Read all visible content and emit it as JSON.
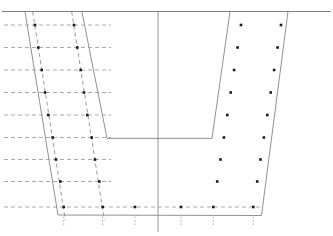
{
  "canvas": {
    "width": 333,
    "height": 236,
    "background": "#ffffff"
  },
  "style": {
    "ground_color": "#7f7f7f",
    "solid_color": "#929292",
    "dashed_color": "#aaaaaa",
    "wall_dashed_color": "#9b9b9b",
    "dot_color": "#1c1c1c",
    "dot_size": 2.6,
    "line_width": 1,
    "ground_line_width": 1.2,
    "dash_pattern": "4 3",
    "tick_pattern": "1.5 2"
  },
  "diagram": {
    "ground_surface_line": {
      "x1": 2,
      "y1": 11.5,
      "x2": 331,
      "y2": 11.5
    },
    "center_axis_line": {
      "x1": 158,
      "y1": 11.5,
      "x2": 158,
      "y2": 232
    },
    "outer_excavation_outline": [
      [
        25,
        12
      ],
      [
        58,
        215
      ],
      [
        261.5,
        215.5
      ],
      [
        288,
        11.5
      ]
    ],
    "inner_excavation_outline": [
      [
        82,
        12
      ],
      [
        107,
        138.4
      ],
      [
        212,
        138.4
      ],
      [
        230,
        11.5
      ]
    ],
    "left_wall_dashed_lines": [
      {
        "x1": 32.7,
        "y1": 11.7,
        "x2": 65.3,
        "y2": 220
      },
      {
        "x1": 71.7,
        "y1": 11.7,
        "x2": 104.3,
        "y2": 220
      }
    ],
    "horizontal_dashed_rows": {
      "x_start": 4,
      "x_end": 111,
      "y_values": [
        25,
        47.5,
        70,
        92.5,
        115,
        137.5,
        159.5,
        181.5
      ]
    },
    "bottom_dashed_row": {
      "x_start": 4,
      "x_end": 260,
      "y": 207
    },
    "node_dots": [
      [
        35,
        25
      ],
      [
        38.3,
        47.5
      ],
      [
        41.7,
        70
      ],
      [
        45,
        92.5
      ],
      [
        48.3,
        115
      ],
      [
        52.7,
        137.5
      ],
      [
        56,
        159.5
      ],
      [
        60.3,
        181.5
      ],
      [
        63.7,
        207
      ],
      [
        74,
        25
      ],
      [
        77.3,
        47.5
      ],
      [
        80.7,
        70
      ],
      [
        84,
        92.5
      ],
      [
        87.3,
        115
      ],
      [
        91.7,
        137.5
      ],
      [
        95,
        159.5
      ],
      [
        99.3,
        181.5
      ],
      [
        102.7,
        207
      ],
      [
        241,
        25
      ],
      [
        237.6,
        47.5
      ],
      [
        234.1,
        70
      ],
      [
        230.7,
        92.5
      ],
      [
        227.3,
        115
      ],
      [
        223.9,
        137.5
      ],
      [
        220.5,
        159.5
      ],
      [
        217.2,
        181.5
      ],
      [
        213.3,
        207
      ],
      [
        281,
        25
      ],
      [
        277.6,
        47.5
      ],
      [
        274.1,
        70
      ],
      [
        270.7,
        92.5
      ],
      [
        267.3,
        115
      ],
      [
        263.9,
        137.5
      ],
      [
        260.5,
        159.5
      ],
      [
        257.2,
        181.5
      ],
      [
        253.3,
        207
      ],
      [
        135,
        207
      ],
      [
        181,
        207
      ]
    ],
    "base_ticks": {
      "y_start": 216.5,
      "y_end": 227,
      "x_values": [
        63.7,
        102.7,
        135,
        181,
        213.3,
        253.3
      ]
    }
  }
}
